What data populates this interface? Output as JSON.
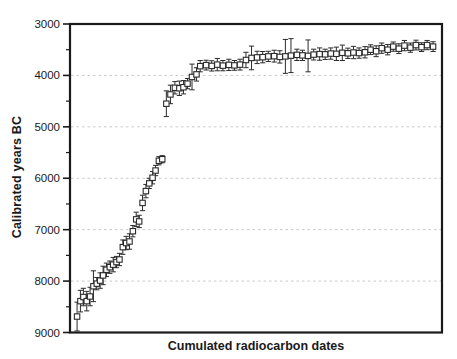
{
  "colors": {
    "background": "#ffffff",
    "axis": "#1a1a1a",
    "grid": "#c9c9c9",
    "marker": "#2b2b2b",
    "marker_fill": "#ffffff"
  },
  "chart_data": {
    "type": "scatter",
    "title": "",
    "xlabel": "Cumulated radiocarbon dates",
    "ylabel": "Calibrated years BC",
    "x_axis": {
      "tick_labels": []
    },
    "y_axis": {
      "min": 3000,
      "max": 9000,
      "inverted": true,
      "major_tick_step": 1000,
      "minor_tick_step": 500,
      "tick_labels": [
        "3000",
        "4000",
        "5000",
        "6000",
        "7000",
        "8000",
        "9000"
      ]
    },
    "gridlines": {
      "y_values": [
        4000,
        5000,
        6000,
        7000,
        8000
      ],
      "style": "dashed"
    },
    "marker": {
      "shape": "open-square",
      "error_bars": "vertical-with-caps"
    },
    "point_format": [
      "x_fraction_along_axis",
      "calibrated_year_BC",
      "error_plus_minus_years"
    ],
    "points": [
      [
        0.019,
        8690,
        280
      ],
      [
        0.028,
        8390,
        210
      ],
      [
        0.036,
        8310,
        170
      ],
      [
        0.045,
        8390,
        190
      ],
      [
        0.054,
        8300,
        180
      ],
      [
        0.063,
        8100,
        300
      ],
      [
        0.072,
        8050,
        120
      ],
      [
        0.081,
        7990,
        150
      ],
      [
        0.089,
        7890,
        180
      ],
      [
        0.098,
        7780,
        130
      ],
      [
        0.107,
        7730,
        120
      ],
      [
        0.116,
        7680,
        140
      ],
      [
        0.125,
        7630,
        110
      ],
      [
        0.133,
        7580,
        120
      ],
      [
        0.142,
        7340,
        140
      ],
      [
        0.151,
        7260,
        130
      ],
      [
        0.16,
        7230,
        150
      ],
      [
        0.169,
        7030,
        110
      ],
      [
        0.178,
        6800,
        140
      ],
      [
        0.186,
        6840,
        120
      ],
      [
        0.195,
        6480,
        150
      ],
      [
        0.204,
        6250,
        130
      ],
      [
        0.213,
        6100,
        100
      ],
      [
        0.222,
        5990,
        120
      ],
      [
        0.23,
        5850,
        100
      ],
      [
        0.239,
        5660,
        80
      ],
      [
        0.248,
        5630,
        70
      ],
      [
        0.259,
        4550,
        250
      ],
      [
        0.27,
        4370,
        180
      ],
      [
        0.282,
        4240,
        120
      ],
      [
        0.294,
        4250,
        140
      ],
      [
        0.305,
        4230,
        130
      ],
      [
        0.316,
        4160,
        100
      ],
      [
        0.328,
        4030,
        250
      ],
      [
        0.34,
        3980,
        130
      ],
      [
        0.35,
        3820,
        110
      ],
      [
        0.366,
        3800,
        95
      ],
      [
        0.381,
        3815,
        100
      ],
      [
        0.396,
        3790,
        120
      ],
      [
        0.411,
        3810,
        100
      ],
      [
        0.427,
        3795,
        110
      ],
      [
        0.442,
        3805,
        95
      ],
      [
        0.457,
        3790,
        105
      ],
      [
        0.473,
        3700,
        150
      ],
      [
        0.488,
        3660,
        230
      ],
      [
        0.503,
        3650,
        120
      ],
      [
        0.518,
        3645,
        110
      ],
      [
        0.533,
        3630,
        100
      ],
      [
        0.549,
        3625,
        115
      ],
      [
        0.564,
        3640,
        120
      ],
      [
        0.579,
        3630,
        330
      ],
      [
        0.594,
        3615,
        330
      ],
      [
        0.61,
        3600,
        110
      ],
      [
        0.625,
        3610,
        100
      ],
      [
        0.64,
        3620,
        310
      ],
      [
        0.655,
        3595,
        105
      ],
      [
        0.671,
        3585,
        120
      ],
      [
        0.686,
        3590,
        100
      ],
      [
        0.701,
        3575,
        110
      ],
      [
        0.716,
        3580,
        130
      ],
      [
        0.732,
        3560,
        150
      ],
      [
        0.747,
        3570,
        100
      ],
      [
        0.762,
        3555,
        120
      ],
      [
        0.777,
        3565,
        100
      ],
      [
        0.793,
        3550,
        110
      ],
      [
        0.808,
        3500,
        95
      ],
      [
        0.823,
        3530,
        105
      ],
      [
        0.838,
        3470,
        100
      ],
      [
        0.854,
        3500,
        100
      ],
      [
        0.869,
        3440,
        90
      ],
      [
        0.884,
        3480,
        95
      ],
      [
        0.899,
        3420,
        100
      ],
      [
        0.915,
        3460,
        90
      ],
      [
        0.93,
        3410,
        95
      ],
      [
        0.945,
        3450,
        85
      ],
      [
        0.96,
        3410,
        90
      ],
      [
        0.976,
        3440,
        95
      ]
    ]
  }
}
